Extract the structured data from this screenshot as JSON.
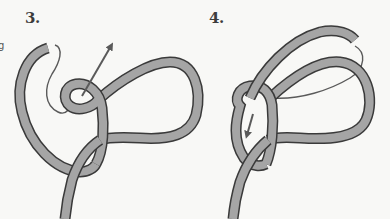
{
  "steps": [
    {
      "label": "3.",
      "description": "Working end passes behind standing part and up through the loop"
    },
    {
      "label": "4.",
      "description": "Working end wraps around and tucks down through the loop"
    }
  ],
  "edge_fragment": "g",
  "colors": {
    "background": "#f8f8f6",
    "rope_fill": "#a5a5a5",
    "rope_outline": "#3a3a3a",
    "arrow": "#5a5a5a",
    "label": "#3c3c3c"
  }
}
